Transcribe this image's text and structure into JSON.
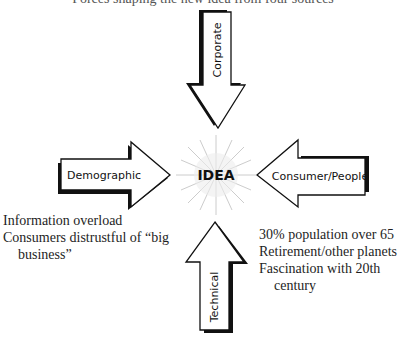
{
  "diagram": {
    "title_cut": "Forces shaping the new idea from four sources",
    "center": {
      "label": "IDEA"
    },
    "arrows": [
      {
        "label": "Corporate",
        "direction": "down",
        "position": "top"
      },
      {
        "label": "Demographic",
        "direction": "right",
        "position": "left"
      },
      {
        "label": "Consumer/People",
        "direction": "left",
        "position": "right"
      },
      {
        "label": "Technical",
        "direction": "up",
        "position": "bottom"
      }
    ],
    "left_notes": [
      {
        "text": "Information overload"
      },
      {
        "text": "Consumers distrustful of “big"
      },
      {
        "text": "business”"
      }
    ],
    "right_notes": [
      {
        "text": "30% population over 65"
      },
      {
        "text": "Retirement/other planets"
      },
      {
        "text": "Fascination with 20th"
      },
      {
        "text": "century"
      }
    ],
    "colors": {
      "stroke": "#111111",
      "fill": "#ffffff",
      "burst": "#bdbdbd"
    }
  }
}
